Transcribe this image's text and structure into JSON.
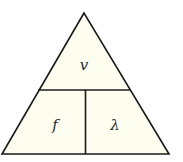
{
  "diagram": {
    "type": "formula-triangle",
    "fill_color": "#fdfdf0",
    "stroke_color": "#1a1a1a",
    "top": {
      "label": "v"
    },
    "bottom_left": {
      "label": "f"
    },
    "bottom_right": {
      "label": "λ"
    }
  }
}
